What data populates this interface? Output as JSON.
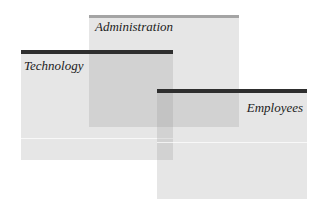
{
  "diagram": {
    "type": "overlapping-panels",
    "panels": [
      {
        "id": "administration",
        "label": "Administration",
        "bar_color": "#a4a4a4"
      },
      {
        "id": "technology",
        "label": "Technology",
        "bar_color": "#2e2e2e"
      },
      {
        "id": "employees",
        "label": "Employees",
        "bar_color": "#2e2e2e"
      }
    ],
    "fill_color": "#8c8c8c"
  }
}
